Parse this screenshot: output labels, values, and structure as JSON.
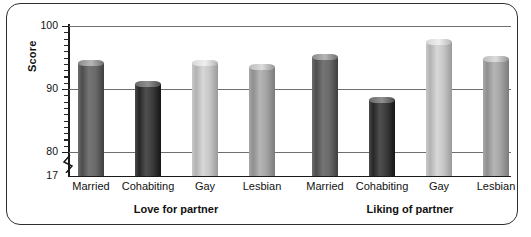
{
  "chart_data": {
    "type": "bar",
    "title": "",
    "xlabel": "",
    "ylabel": "Score",
    "ylim": [
      17,
      100
    ],
    "y_ticks": [
      "100",
      "90",
      "80",
      "17"
    ],
    "axis_break": true,
    "grid": true,
    "legend": "none",
    "groups": [
      {
        "label": "Love for partner",
        "categories": [
          "Married",
          "Cohabiting",
          "Gay",
          "Lesbian"
        ],
        "values": [
          94.6,
          91.2,
          94.6,
          94.0
        ]
      },
      {
        "label": "Liking of partner",
        "categories": [
          "Married",
          "Cohabiting",
          "Gay",
          "Lesbian"
        ],
        "values": [
          95.5,
          88.7,
          98.0,
          95.2
        ]
      }
    ],
    "series_colors": {
      "Married": "#5c5c5c",
      "Cohabiting": "#2b2b2b",
      "Gay": "#c6c6c6",
      "Lesbian": "#a0a0a0"
    }
  }
}
